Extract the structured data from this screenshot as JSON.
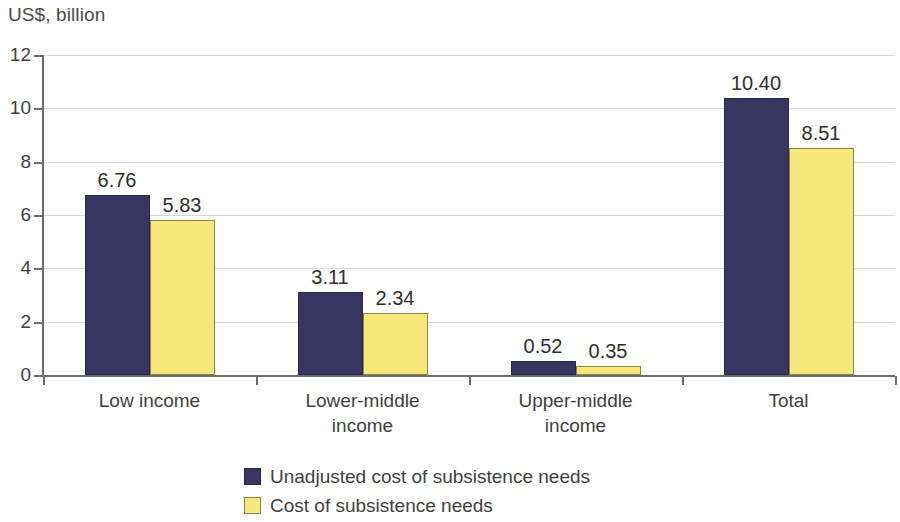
{
  "chart_data": {
    "type": "bar",
    "title": "US$, billion",
    "xlabel": "",
    "ylabel": "US$, billion",
    "ylim": [
      0,
      12
    ],
    "yticks": [
      "0",
      "2",
      "4",
      "6",
      "8",
      "10",
      "12"
    ],
    "grid": true,
    "legend_position": "bottom",
    "categories": [
      "Low income",
      "Lower-middle\nincome",
      "Upper-middle\nincome",
      "Total"
    ],
    "series": [
      {
        "name": "Unadjusted cost of subsistence needs",
        "color": "#383561",
        "values": [
          6.76,
          3.11,
          0.52,
          10.4
        ],
        "labels": [
          "6.76",
          "3.11",
          "0.52",
          "10.40"
        ]
      },
      {
        "name": "Cost of subsistence needs",
        "color": "#f7e87c",
        "values": [
          5.83,
          2.34,
          0.35,
          8.51
        ],
        "labels": [
          "5.83",
          "2.34",
          "0.35",
          "8.51"
        ]
      }
    ]
  },
  "legend": {
    "items": [
      {
        "label": "Unadjusted cost of subsistence needs",
        "swatch": "navy"
      },
      {
        "label": "Cost of subsistence needs",
        "swatch": "yellow"
      }
    ]
  }
}
